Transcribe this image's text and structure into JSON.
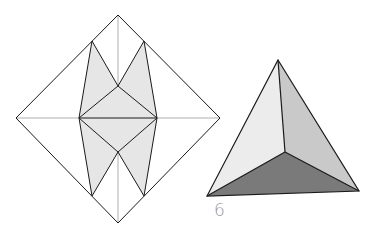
{
  "figure": {
    "step_number": "6",
    "colors": {
      "line": "#1a1a1a",
      "crease": "#9a9a9a",
      "fold_fill": "#e6e6e6",
      "face_light": "#ececec",
      "face_mid": "#c9c9c9",
      "face_dark": "#7a7a7a"
    },
    "crease_pattern": {
      "outline": [
        [
          118,
          15
        ],
        [
          220,
          118
        ],
        [
          118,
          223
        ],
        [
          16,
          118
        ]
      ],
      "shaded_regions": [
        [
          [
            92,
            41
          ],
          [
            118,
            86
          ],
          [
            79,
            118
          ]
        ],
        [
          [
            144,
            41
          ],
          [
            157,
            118
          ],
          [
            118,
            86
          ]
        ],
        [
          [
            79,
            118
          ],
          [
            118,
            86
          ],
          [
            157,
            118
          ],
          [
            118,
            152
          ]
        ],
        [
          [
            79,
            118
          ],
          [
            118,
            152
          ],
          [
            92,
            196
          ]
        ],
        [
          [
            157,
            118
          ],
          [
            144,
            196
          ],
          [
            118,
            152
          ]
        ]
      ]
    },
    "tetrahedron": {
      "apex": [
        278,
        60
      ],
      "bottom_left": [
        207,
        196
      ],
      "bottom_right": [
        359,
        191
      ],
      "center": [
        285,
        152
      ]
    }
  }
}
